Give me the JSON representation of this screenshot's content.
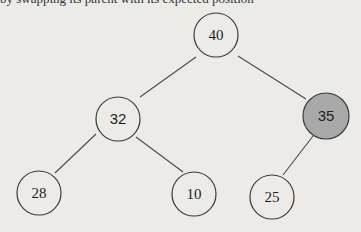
{
  "diagram": {
    "type": "binary-tree",
    "top_text_cut": "by swapping its parent with its expected position",
    "colors": {
      "node_fill": "#ecebe8",
      "highlight_fill": "#a9a9a9",
      "stroke": "#3a3a3a"
    },
    "nodes": [
      {
        "id": "n40",
        "label": "40",
        "cx": 216,
        "cy": 35,
        "highlight": false
      },
      {
        "id": "n32",
        "label": "32",
        "cx": 118,
        "cy": 119,
        "highlight": false
      },
      {
        "id": "n35",
        "label": "35",
        "cx": 326,
        "cy": 116,
        "highlight": true
      },
      {
        "id": "n28",
        "label": "28",
        "cx": 39,
        "cy": 193,
        "highlight": false
      },
      {
        "id": "n10",
        "label": "10",
        "cx": 194,
        "cy": 194,
        "highlight": false
      },
      {
        "id": "n25",
        "label": "25",
        "cx": 272,
        "cy": 197,
        "highlight": false
      }
    ],
    "edges": [
      {
        "from": "40",
        "to": "32"
      },
      {
        "from": "40",
        "to": "35"
      },
      {
        "from": "32",
        "to": "28"
      },
      {
        "from": "32",
        "to": "10"
      },
      {
        "from": "35",
        "to": "25"
      }
    ]
  }
}
